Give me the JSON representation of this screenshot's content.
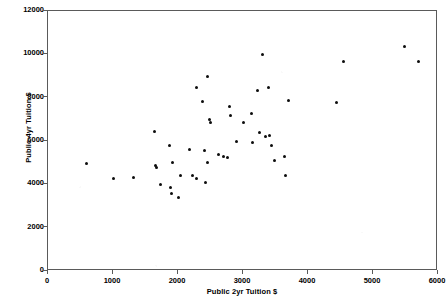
{
  "chart_data": {
    "type": "scatter",
    "title": "",
    "xlabel": "Public 2yr Tuition $",
    "ylabel": "Public 4yr Tuition $",
    "xlim": [
      0,
      6000
    ],
    "ylim": [
      0,
      12000
    ],
    "xticks": [
      0,
      1000,
      2000,
      3000,
      4000,
      5000,
      6000
    ],
    "yticks": [
      0,
      2000,
      4000,
      6000,
      8000,
      10000,
      12000
    ],
    "xtick_labels": [
      "0",
      "1000",
      "2000",
      "3000",
      "4000",
      "5000",
      "6000"
    ],
    "ytick_labels": [
      "0",
      "2000",
      "4000",
      "6000",
      "8000",
      "10000",
      "12000"
    ],
    "grid": false,
    "legend": null,
    "marker_color": "#0d0d0d",
    "marker_size": 3,
    "series": [
      {
        "name": "States",
        "points": [
          [
            585,
            4970
          ],
          [
            1000,
            4270
          ],
          [
            1310,
            4310
          ],
          [
            1645,
            6430
          ],
          [
            1660,
            4890
          ],
          [
            1665,
            4800
          ],
          [
            1725,
            3970
          ],
          [
            1870,
            5780
          ],
          [
            1885,
            3840
          ],
          [
            1900,
            3570
          ],
          [
            1920,
            5020
          ],
          [
            2000,
            3370
          ],
          [
            2045,
            4400
          ],
          [
            2170,
            5600
          ],
          [
            2230,
            4400
          ],
          [
            2280,
            4260
          ],
          [
            2290,
            8480
          ],
          [
            2370,
            7810
          ],
          [
            2400,
            5540
          ],
          [
            2420,
            4070
          ],
          [
            2450,
            9000
          ],
          [
            2460,
            4990
          ],
          [
            2490,
            7000
          ],
          [
            2500,
            6840
          ],
          [
            2620,
            5370
          ],
          [
            2700,
            5280
          ],
          [
            2755,
            5250
          ],
          [
            2790,
            7600
          ],
          [
            2810,
            7170
          ],
          [
            2900,
            5980
          ],
          [
            3000,
            6870
          ],
          [
            3130,
            7280
          ],
          [
            3150,
            5950
          ],
          [
            3230,
            8350
          ],
          [
            3260,
            6400
          ],
          [
            3300,
            9980
          ],
          [
            3350,
            6210
          ],
          [
            3390,
            8470
          ],
          [
            3410,
            6260
          ],
          [
            3440,
            5780
          ],
          [
            3480,
            5090
          ],
          [
            3640,
            5300
          ],
          [
            3660,
            4410
          ],
          [
            3700,
            7880
          ],
          [
            4440,
            7800
          ],
          [
            4550,
            9670
          ],
          [
            5490,
            10370
          ],
          [
            5700,
            9660
          ]
        ]
      }
    ]
  }
}
